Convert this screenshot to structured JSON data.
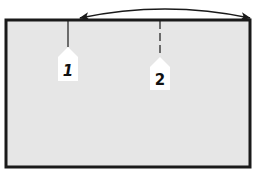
{
  "diagram": {
    "panel": {
      "fill": "#e6e6e6",
      "stroke": "#1a1a1a"
    },
    "arrow": {
      "type": "double-headed-curved",
      "color": "#1a1a1a"
    },
    "markers": [
      {
        "id": "1",
        "label": "1",
        "line_style": "solid",
        "label_style": "italic"
      },
      {
        "id": "2",
        "label": "2",
        "line_style": "dashed",
        "label_style": "upright"
      }
    ],
    "marker_fill": "#ffffff",
    "marker_line_color": "#1a1a1a"
  }
}
